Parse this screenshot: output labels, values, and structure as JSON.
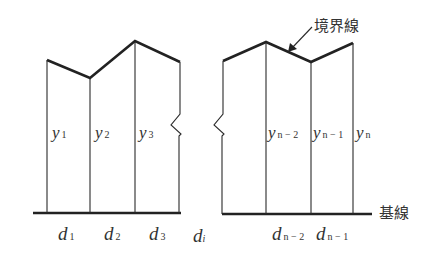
{
  "diagram": {
    "labels": {
      "boundary_line": "境界線",
      "baseline": "基線"
    },
    "heights": [
      {
        "var": "y",
        "sub": "1"
      },
      {
        "var": "y",
        "sub": "2"
      },
      {
        "var": "y",
        "sub": "3"
      },
      {
        "var": "y",
        "sub": "n − 2"
      },
      {
        "var": "y",
        "sub": "n − 1"
      },
      {
        "var": "y",
        "sub": "n"
      }
    ],
    "widths": [
      {
        "var": "d",
        "sub": "1"
      },
      {
        "var": "d",
        "sub": "2"
      },
      {
        "var": "d",
        "sub": "3"
      },
      {
        "var": "d",
        "sub": "i"
      },
      {
        "var": "d",
        "sub": "n − 2"
      },
      {
        "var": "d",
        "sub": "n − 1"
      }
    ],
    "colors": {
      "line": "#222222",
      "text": "#333333",
      "background": "#ffffff"
    }
  }
}
